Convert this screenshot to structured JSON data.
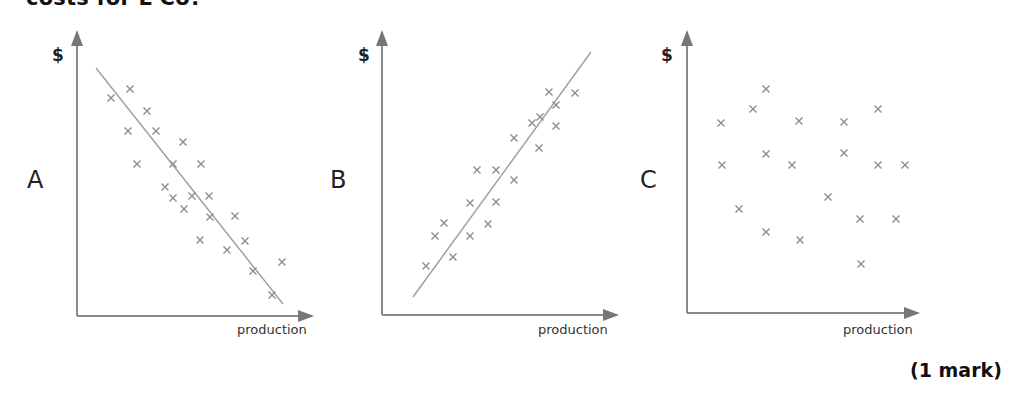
{
  "question": {
    "text": "costs for L Co?"
  },
  "mark": {
    "text": "(1 mark)"
  },
  "chart_data": [
    {
      "type": "scatter",
      "panel": "A",
      "title": "A",
      "xlabel": "production",
      "ylabel": "$",
      "trend": "negative",
      "trend_line": {
        "x1": 96,
        "y1": 68,
        "x2": 283,
        "y2": 304
      },
      "axes": {
        "origin": [
          77,
          316
        ],
        "x_end": 312,
        "y_end": 32
      },
      "points": [
        [
          111,
          98
        ],
        [
          130,
          89
        ],
        [
          147,
          111
        ],
        [
          128,
          131
        ],
        [
          156,
          131
        ],
        [
          183,
          142
        ],
        [
          137,
          164
        ],
        [
          173,
          164
        ],
        [
          201,
          164
        ],
        [
          165,
          187
        ],
        [
          173,
          198
        ],
        [
          192,
          196
        ],
        [
          209,
          196
        ],
        [
          184,
          209
        ],
        [
          210,
          217
        ],
        [
          235,
          216
        ],
        [
          200,
          240
        ],
        [
          245,
          241
        ],
        [
          227,
          250
        ],
        [
          253,
          271
        ],
        [
          282,
          262
        ],
        [
          272,
          295
        ]
      ],
      "grid": false
    },
    {
      "type": "scatter",
      "panel": "B",
      "title": "B",
      "xlabel": "production",
      "ylabel": "$",
      "trend": "positive",
      "trend_line": {
        "x1": 413,
        "y1": 297,
        "x2": 591,
        "y2": 52
      },
      "axes": {
        "origin": [
          382,
          315
        ],
        "x_end": 617,
        "y_end": 32
      },
      "points": [
        [
          426,
          266
        ],
        [
          435,
          236
        ],
        [
          444,
          223
        ],
        [
          453,
          257
        ],
        [
          470,
          236
        ],
        [
          470,
          203
        ],
        [
          477,
          170
        ],
        [
          496,
          170
        ],
        [
          496,
          202
        ],
        [
          488,
          224
        ],
        [
          514,
          180
        ],
        [
          514,
          138
        ],
        [
          532,
          123
        ],
        [
          540,
          117
        ],
        [
          539,
          148
        ],
        [
          549,
          92
        ],
        [
          556,
          105
        ],
        [
          556,
          126
        ],
        [
          575,
          93
        ]
      ],
      "grid": false
    },
    {
      "type": "scatter",
      "panel": "C",
      "title": "C",
      "xlabel": "production",
      "ylabel": "$",
      "trend": "none",
      "trend_line": null,
      "axes": {
        "origin": [
          687,
          313
        ],
        "x_end": 918,
        "y_end": 32
      },
      "points": [
        [
          766,
          89
        ],
        [
          753,
          109
        ],
        [
          721,
          123
        ],
        [
          799,
          121
        ],
        [
          844,
          122
        ],
        [
          878,
          109
        ],
        [
          766,
          154
        ],
        [
          844,
          153
        ],
        [
          722,
          165
        ],
        [
          792,
          165
        ],
        [
          878,
          165
        ],
        [
          905,
          165
        ],
        [
          828,
          197
        ],
        [
          739,
          209
        ],
        [
          860,
          219
        ],
        [
          896,
          219
        ],
        [
          766,
          232
        ],
        [
          800,
          240
        ],
        [
          861,
          264
        ]
      ],
      "grid": false
    }
  ],
  "panels": [
    {
      "label": "A",
      "ylabel": "$",
      "xlabel": "production"
    },
    {
      "label": "B",
      "ylabel": "$",
      "xlabel": "production"
    },
    {
      "label": "C",
      "ylabel": "$",
      "xlabel": "production"
    }
  ],
  "colors": {
    "axis": "#8a8a8a",
    "marker": "#8c8c8c",
    "trend_line": "#a0a0a0",
    "text": "#222222"
  }
}
